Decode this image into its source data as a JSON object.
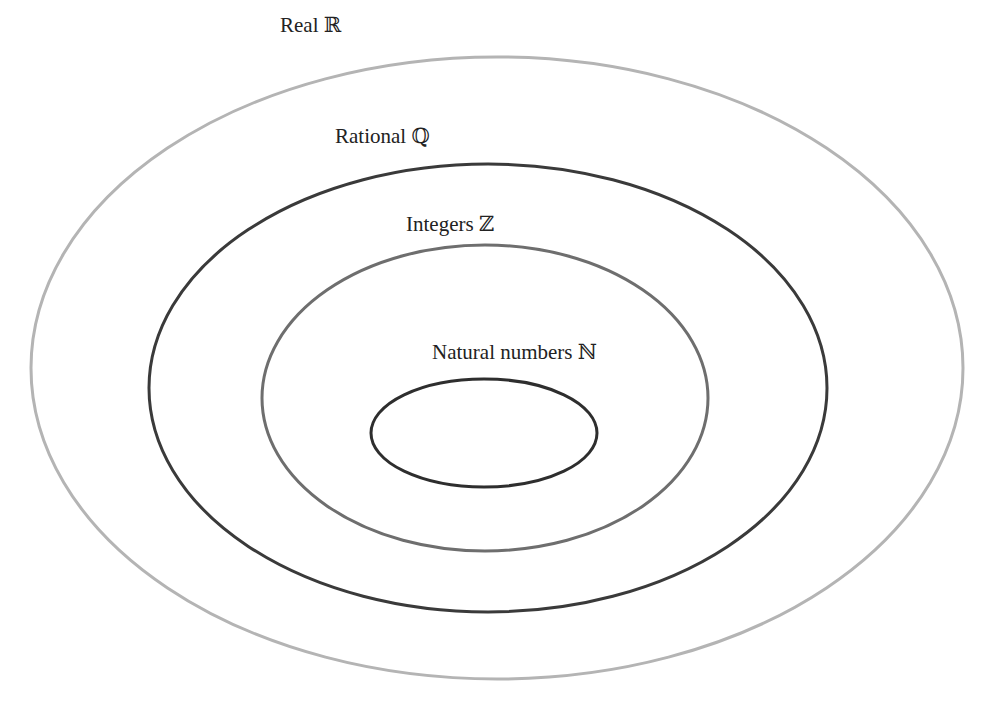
{
  "header_cutoff_text": "Figure showing the number sets",
  "sets": [
    {
      "id": "real",
      "label": "Real ℝ",
      "color": "#b4b4b4"
    },
    {
      "id": "rational",
      "label": "Rational ℚ",
      "color": "#3a3a3a"
    },
    {
      "id": "integers",
      "label": "Integers ℤ",
      "color": "#6e6e6e"
    },
    {
      "id": "natural",
      "label": "Natural numbers ℕ",
      "color": "#2e2e2e"
    }
  ]
}
